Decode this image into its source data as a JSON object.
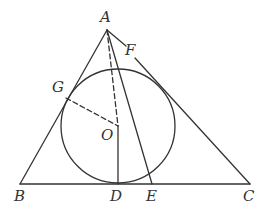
{
  "diagram": {
    "type": "geometry",
    "points": {
      "A": {
        "label": "A",
        "x": 107,
        "y": 30
      },
      "B": {
        "label": "B",
        "x": 20,
        "y": 184
      },
      "C": {
        "label": "C",
        "x": 250,
        "y": 184
      },
      "D": {
        "label": "D",
        "x": 118,
        "y": 184
      },
      "E": {
        "label": "E",
        "x": 152,
        "y": 184
      },
      "F": {
        "label": "F",
        "x": 136,
        "y": 57
      },
      "G": {
        "label": "G",
        "x": 66,
        "y": 98
      },
      "O": {
        "label": "O",
        "x": 118,
        "y": 126
      }
    },
    "circle": {
      "center": "O",
      "cx": 118,
      "cy": 126,
      "r": 57
    },
    "segments": [
      {
        "from": "A",
        "to": "B",
        "style": "solid"
      },
      {
        "from": "A",
        "to": "C",
        "style": "solid"
      },
      {
        "from": "B",
        "to": "C",
        "style": "solid"
      },
      {
        "from": "A",
        "to": "O",
        "style": "dashed"
      },
      {
        "from": "O",
        "to": "D",
        "style": "solid"
      },
      {
        "from": "G",
        "to": "O",
        "style": "dashed"
      },
      {
        "from": "A",
        "to": "E",
        "style": "solid"
      }
    ],
    "colors": {
      "stroke": "#333333",
      "background": "#ffffff"
    }
  }
}
